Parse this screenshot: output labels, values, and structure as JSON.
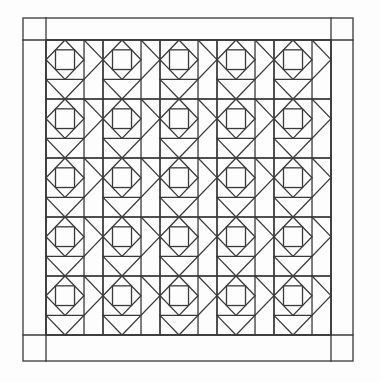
{
  "diagram": {
    "type": "quilt-pattern",
    "background": "#fdfdfd",
    "line_color": "#3a3a3a",
    "outer_border": {
      "x": 23,
      "y": 18,
      "width": 330,
      "height": 343
    },
    "inner_field": {
      "x": 46,
      "y": 40,
      "width": 285,
      "height": 295
    },
    "grid": {
      "columns": 5,
      "rows": 5
    },
    "block": {
      "name": "square-in-square with triangles",
      "square_fraction": 0.667,
      "parts": [
        "corner-square",
        "diamond",
        "inner-square",
        "right-strip-triangle",
        "bottom-strip-triangle",
        "long-diagonal"
      ]
    },
    "corner_squares": 4
  }
}
